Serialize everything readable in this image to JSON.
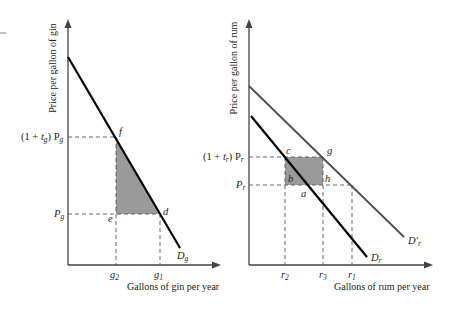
{
  "corner_mark": "-",
  "gin_panel": {
    "y_axis_label": "Price per gallon of gin",
    "x_axis_label": "Gallons of gin per year",
    "price_high_label_prefix": "(1 + ",
    "price_high_label_t": "t",
    "price_high_label_t_sub": "g",
    "price_high_label_suffix": ") P",
    "price_high_label_p_sub": "g",
    "price_low_label": "P",
    "price_low_label_sub": "g",
    "qty_labels": [
      {
        "main": "g",
        "sub": "2"
      },
      {
        "main": "g",
        "sub": "1"
      }
    ],
    "points": {
      "f": "f",
      "e": "e",
      "d": "d"
    },
    "demand_label": "D",
    "demand_label_sub": "g"
  },
  "rum_panel": {
    "y_axis_label": "Price per gallon of rum",
    "x_axis_label": "Gallons of rum per year",
    "price_high_label_prefix": "(1 + ",
    "price_high_label_t": "t",
    "price_high_label_t_sub": "r",
    "price_high_label_suffix": ") P",
    "price_high_label_p_sub": "r",
    "price_low_label": "P",
    "price_low_label_sub": "r",
    "qty_labels": [
      {
        "main": "r",
        "sub": "2"
      },
      {
        "main": "r",
        "sub": "3"
      },
      {
        "main": "r",
        "sub": "1"
      }
    ],
    "points": {
      "c": "c",
      "g": "g",
      "b": "b",
      "h": "h",
      "a": "a"
    },
    "demand_label": "D",
    "demand_label_sub": "r",
    "demand_shift_label": "D′",
    "demand_shift_label_sub": "r"
  },
  "colors": {
    "shade": "#9a9a9a",
    "demand_original": "#000000",
    "demand_shifted": "#4d4d4d",
    "axis": "#444444"
  }
}
